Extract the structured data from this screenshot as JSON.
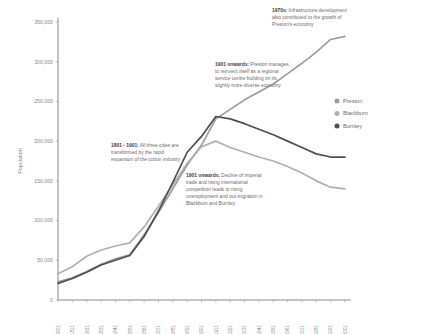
{
  "chart_data": {
    "type": "line",
    "title": "",
    "xlabel": "",
    "ylabel": "Population",
    "ylim": [
      0,
      350000
    ],
    "ytick_labels": [
      "0",
      "50,000",
      "100,000",
      "150,000",
      "200,000",
      "250,000",
      "300,000",
      "350,000"
    ],
    "ytick_values": [
      0,
      50000,
      100000,
      150000,
      200000,
      250000,
      300000,
      350000
    ],
    "grid": false,
    "legend_position": "right",
    "categories": [
      "1801",
      "1811",
      "1821",
      "1831",
      "1841",
      "1851",
      "1861",
      "1871",
      "1881",
      "1891",
      "1901",
      "1911",
      "1921",
      "1931",
      "1941",
      "1951",
      "1961",
      "1971",
      "1981",
      "1991",
      "2001"
    ],
    "series": [
      {
        "name": "Preston",
        "color": "#9d9d9d",
        "values": [
          23000,
          28000,
          36000,
          45000,
          52000,
          57000,
          82000,
          110000,
          140000,
          170000,
          195000,
          228000,
          240000,
          252000,
          262000,
          272000,
          285000,
          298000,
          312000,
          328000,
          332000
        ]
      },
      {
        "name": "Blackburn",
        "color": "#b0b0b0",
        "values": [
          33000,
          42000,
          55000,
          63000,
          68000,
          72000,
          92000,
          118000,
          145000,
          172000,
          193000,
          200000,
          192000,
          186000,
          180000,
          175000,
          168000,
          160000,
          150000,
          142000,
          140000
        ]
      },
      {
        "name": "Burnley",
        "color": "#4f4f4f",
        "values": [
          21000,
          27000,
          35000,
          44000,
          50000,
          56000,
          80000,
          112000,
          148000,
          186000,
          206000,
          231000,
          228000,
          222000,
          215000,
          208000,
          200000,
          192000,
          184000,
          180000,
          180000
        ]
      }
    ],
    "annotations": [
      {
        "id": "1970s",
        "lead": "1970s:",
        "text": " Infrastructure development also contributed to the growth of Preston's economy"
      },
      {
        "id": "1901-preston",
        "lead": "1901 onwards:",
        "text": " Preston manages to reinvent itself as a regional service centre building on its slightly more diverse economy"
      },
      {
        "id": "1801-1901",
        "lead": "1801 - 1901:",
        "text": " All three cities are transformed by the rapid expansion of the cotton industry"
      },
      {
        "id": "1901-decline",
        "lead": "1901 onwards:",
        "text": " Decline of imperial trade and rising international competition leads to rising unemployment and out-migration in Blackburn and Burnley"
      }
    ]
  }
}
